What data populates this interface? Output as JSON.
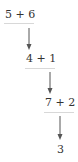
{
  "diagram": {
    "type": "reduction-chain",
    "nodes": [
      {
        "id": "n1",
        "label": "5 + 6"
      },
      {
        "id": "n2",
        "label": "4 + 1"
      },
      {
        "id": "n3",
        "label": "7 + 2"
      },
      {
        "id": "n4",
        "label": "3"
      }
    ],
    "edges": [
      {
        "from": "n1",
        "to": "n2"
      },
      {
        "from": "n2",
        "to": "n3"
      },
      {
        "from": "n3",
        "to": "n4"
      }
    ],
    "colors": {
      "text": "#333333",
      "arrow": "#555555",
      "underline": "#d8d8d8"
    }
  }
}
